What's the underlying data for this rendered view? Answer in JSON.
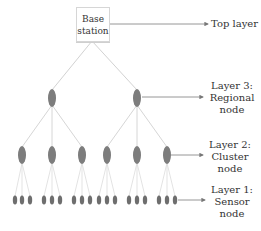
{
  "diagram": {
    "base_station": {
      "line1": "Base",
      "line2": "station"
    },
    "layers": [
      {
        "id": "top",
        "line1": "Top layer"
      },
      {
        "id": "layer3",
        "line1": "Layer 3:",
        "line2": "Regional",
        "line3": "node"
      },
      {
        "id": "layer2",
        "line1": "Layer 2:",
        "line2": "Cluster",
        "line3": "node"
      },
      {
        "id": "layer1",
        "line1": "Layer 1:",
        "line2": "Sensor",
        "line3": "node"
      }
    ],
    "structure": {
      "regional_nodes": 2,
      "cluster_nodes_per_regional": 3,
      "sensor_nodes_per_cluster": 3
    },
    "colors": {
      "node_fill": "#7a7a7a",
      "edge": "#d0d0d0",
      "arrow": "#888888",
      "text": "#333333"
    }
  }
}
